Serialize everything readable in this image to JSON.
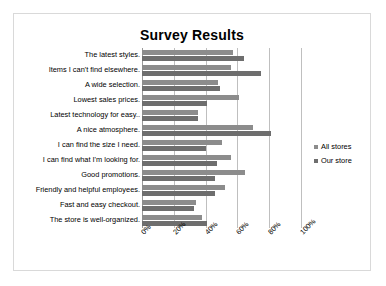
{
  "chart_data": {
    "type": "bar",
    "orientation": "horizontal",
    "title": "Survey Results",
    "xlabel": "",
    "ylabel": "",
    "xlim": [
      0,
      100
    ],
    "xticks": [
      "0%",
      "20%",
      "40%",
      "60%",
      "80%",
      "100%"
    ],
    "xtick_values": [
      0,
      20,
      40,
      60,
      80,
      100
    ],
    "grid": true,
    "legend_position": "right",
    "categories": [
      "The latest styles.",
      "Items I can't find elsewhere.",
      "A wide selection.",
      "Lowest sales prices.",
      "Latest technology for easy..",
      "A nice atmosphere.",
      "I can find the size I need.",
      "I can find what I'm looking for.",
      "Good promotions.",
      "Friendly and helpful employees.",
      "Fast and easy checkout.",
      "The store is well-organized."
    ],
    "series": [
      {
        "name": "All stores",
        "color": "#8c8c8c",
        "values": [
          57,
          56,
          48,
          61,
          35,
          70,
          50,
          56,
          65,
          52,
          34,
          38
        ]
      },
      {
        "name": "Our store",
        "color": "#6e6e6e",
        "values": [
          64,
          75,
          49,
          41,
          35,
          81,
          40,
          47,
          46,
          46,
          33,
          41
        ]
      }
    ]
  },
  "legend": {
    "items": [
      {
        "label": "All stores"
      },
      {
        "label": "Our store"
      }
    ]
  }
}
